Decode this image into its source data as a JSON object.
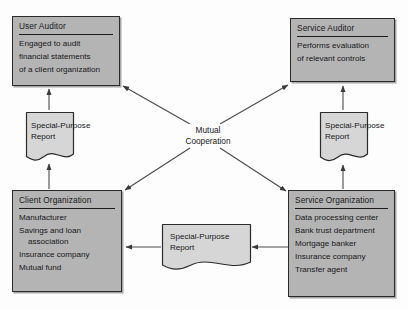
{
  "diagram": {
    "center": {
      "line1": "Mutual",
      "line2": "Cooperation"
    },
    "colors": {
      "box_fill": "#b4b4b4",
      "box_border": "#2b2b2b",
      "report_fill": "#d6d6d6",
      "line": "#4a4a4a",
      "background": "#fdfdfd"
    },
    "boxes": [
      {
        "id": "user-auditor",
        "title": "User Auditor",
        "lines": [
          {
            "text": "Engaged to audit",
            "continuation": false
          },
          {
            "text": "financial statements",
            "continuation": false
          },
          {
            "text": "of a client organization",
            "continuation": false
          }
        ]
      },
      {
        "id": "service-auditor",
        "title": "Service Auditor",
        "lines": [
          {
            "text": "Performs evaluation",
            "continuation": false
          },
          {
            "text": "of relevant controls",
            "continuation": false
          }
        ]
      },
      {
        "id": "client-organization",
        "title": "Client Organization",
        "lines": [
          {
            "text": "Manufacturer",
            "continuation": false
          },
          {
            "text": "Savings and loan",
            "continuation": false
          },
          {
            "text": "association",
            "continuation": true
          },
          {
            "text": "Insurance company",
            "continuation": false
          },
          {
            "text": "Mutual fund",
            "continuation": false
          }
        ]
      },
      {
        "id": "service-organization",
        "title": "Service Organization",
        "lines": [
          {
            "text": "Data processing center",
            "continuation": false
          },
          {
            "text": "Bank trust department",
            "continuation": false
          },
          {
            "text": "Mortgage banker",
            "continuation": false
          },
          {
            "text": "Insurance company",
            "continuation": false
          },
          {
            "text": "Transfer agent",
            "continuation": false
          }
        ]
      }
    ],
    "reports": [
      {
        "id": "report-left",
        "line1": "Special-Purpose",
        "line2": "Report"
      },
      {
        "id": "report-right",
        "line1": "Special-Purpose",
        "line2": "Report"
      },
      {
        "id": "report-middle",
        "line1": "Special-Purpose",
        "line2": "Report"
      }
    ]
  }
}
